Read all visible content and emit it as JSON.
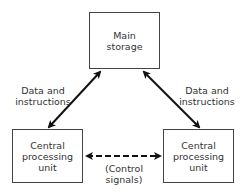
{
  "diagram": {
    "nodes": [
      {
        "id": "main-storage",
        "label": "Main\nstorage"
      },
      {
        "id": "cpu-left",
        "label": "Central\nprocessing\nunit"
      },
      {
        "id": "cpu-right",
        "label": "Central\nprocessing\nunit"
      }
    ],
    "edges": [
      {
        "from": "main-storage",
        "to": "cpu-left",
        "label": "Data and\ninstructions",
        "style": "solid",
        "direction": "both"
      },
      {
        "from": "main-storage",
        "to": "cpu-right",
        "label": "Data and\ninstructions",
        "style": "solid",
        "direction": "both"
      },
      {
        "from": "cpu-left",
        "to": "cpu-right",
        "label": "(Control\nsignals)",
        "style": "dashed",
        "direction": "both"
      }
    ]
  },
  "colors": {
    "line": "#111111",
    "border": "#444444",
    "text": "#333333",
    "background": "#ffffff"
  }
}
